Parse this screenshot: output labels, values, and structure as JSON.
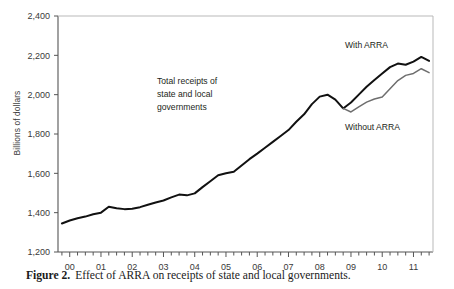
{
  "figure": {
    "caption_prefix": "Figure 2.",
    "caption_text": "Effect of ARRA on receipts of state and local governments."
  },
  "axes": {
    "ylabel": "Billions of dollars",
    "ytick_labels": [
      "2,400",
      "2,200",
      "2,000",
      "1,800",
      "1,600",
      "1,400",
      "1,200"
    ],
    "xtick_labels": [
      "00",
      "01",
      "02",
      "03",
      "04",
      "05",
      "06",
      "07",
      "08",
      "09",
      "10",
      "11"
    ]
  },
  "annotations": {
    "series_note_line1": "Total receipts of",
    "series_note_line2": "state and local",
    "series_note_line3": "governments",
    "with_arra": "With ARRA",
    "without_arra": "Without ARRA"
  },
  "colors": {
    "with_arra_line": "#111111",
    "without_arra_line": "#6e6e6e",
    "axis": "#555555",
    "frame": "#b9b9b9",
    "text": "#231f20"
  },
  "chart_data": {
    "type": "line",
    "title": "",
    "xlabel": "",
    "ylabel": "Billions of dollars",
    "xlim": [
      1999.625,
      2011.625
    ],
    "ylim": [
      1200,
      2400
    ],
    "ytick_values": [
      1200,
      1400,
      1600,
      1800,
      2000,
      2200,
      2400
    ],
    "xtick_values": [
      2000,
      2001,
      2002,
      2003,
      2004,
      2005,
      2006,
      2007,
      2008,
      2009,
      2010,
      2011
    ],
    "xtick_labels": [
      "00",
      "01",
      "02",
      "03",
      "04",
      "05",
      "06",
      "07",
      "08",
      "09",
      "10",
      "11"
    ],
    "grid": false,
    "legend": "annotated-inline",
    "x_unit": "calendar quarter",
    "series": [
      {
        "name": "Total receipts of state and local governments (history and With ARRA)",
        "label": "With ARRA",
        "color": "#111111",
        "x": [
          1999.75,
          2000.0,
          2000.25,
          2000.5,
          2000.75,
          2001.0,
          2001.25,
          2001.5,
          2001.75,
          2002.0,
          2002.25,
          2002.5,
          2002.75,
          2003.0,
          2003.25,
          2003.5,
          2003.75,
          2004.0,
          2004.25,
          2004.5,
          2004.75,
          2005.0,
          2005.25,
          2005.5,
          2005.75,
          2006.0,
          2006.25,
          2006.5,
          2006.75,
          2007.0,
          2007.25,
          2007.5,
          2007.75,
          2008.0,
          2008.25,
          2008.5,
          2008.75,
          2009.0,
          2009.25,
          2009.5,
          2009.75,
          2010.0,
          2010.25,
          2010.5,
          2010.75,
          2011.0,
          2011.25,
          2011.5
        ],
        "values": [
          1345,
          1360,
          1372,
          1380,
          1392,
          1400,
          1430,
          1422,
          1418,
          1420,
          1428,
          1440,
          1452,
          1462,
          1478,
          1492,
          1488,
          1498,
          1530,
          1560,
          1590,
          1600,
          1608,
          1640,
          1672,
          1700,
          1730,
          1760,
          1790,
          1820,
          1862,
          1900,
          1952,
          1990,
          2000,
          1975,
          1930,
          1960,
          2000,
          2040,
          2075,
          2108,
          2140,
          2158,
          2152,
          2168,
          2192,
          2172
        ]
      },
      {
        "name": "Total receipts of state and local governments (Without ARRA)",
        "label": "Without ARRA",
        "color": "#6e6e6e",
        "x": [
          2008.75,
          2009.0,
          2009.25,
          2009.5,
          2009.75,
          2010.0,
          2010.25,
          2010.5,
          2010.75,
          2011.0,
          2011.25,
          2011.5
        ],
        "values": [
          1930,
          1912,
          1938,
          1962,
          1978,
          1988,
          2030,
          2072,
          2098,
          2108,
          2132,
          2112
        ]
      }
    ]
  }
}
